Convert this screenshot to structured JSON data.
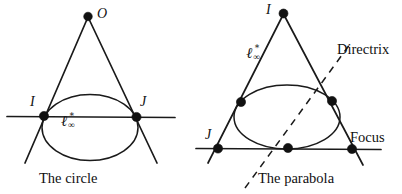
{
  "figure": {
    "background_color": "#ffffff",
    "ink_color": "#111111",
    "width": 402,
    "height": 194
  },
  "left_panel": {
    "caption": "The circle",
    "labels": {
      "apex": "O",
      "left_point": "I",
      "right_point": "J",
      "line_at_infinity_base": "ℓ",
      "line_at_infinity_sup": "∗",
      "line_at_infinity_sub": "∞"
    }
  },
  "right_panel": {
    "caption": "The parabola",
    "labels": {
      "apex": "I",
      "lower_left_point": "J",
      "directrix": "Directrix",
      "focus": "Focus",
      "line_at_infinity_base": "ℓ",
      "line_at_infinity_sup": "∗",
      "line_at_infinity_sub": "∞"
    }
  }
}
